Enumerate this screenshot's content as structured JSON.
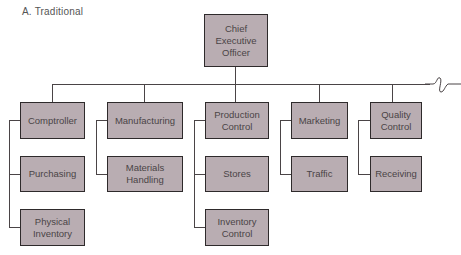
{
  "diagram": {
    "title": "A. Traditional",
    "type": "organization-chart",
    "root": {
      "label": "Chief\nExecutive\nOfficer"
    },
    "departments": [
      {
        "label": "Comptroller",
        "children": [
          "Purchasing",
          "Physical Inventory"
        ]
      },
      {
        "label": "Manufacturing",
        "children": [
          "Materials Handling"
        ]
      },
      {
        "label": "Production Control",
        "children": [
          "Stores",
          "Inventory Control"
        ]
      },
      {
        "label": "Marketing",
        "children": [
          "Traffic"
        ]
      },
      {
        "label": "Quality Control",
        "children": [
          "Receiving"
        ]
      }
    ],
    "colors": {
      "box_fill": "#b9adb2",
      "box_border": "#2e2a2b",
      "line": "#4a4446"
    }
  },
  "labels": {
    "ceo_1": "Chief",
    "ceo_2": "Executive",
    "ceo_3": "Officer",
    "comptroller": "Comptroller",
    "purchasing": "Purchasing",
    "physical_1": "Physical",
    "physical_2": "Inventory",
    "manufacturing": "Manufacturing",
    "materials_1": "Materials",
    "materials_2": "Handling",
    "production_1": "Production",
    "production_2": "Control",
    "stores": "Stores",
    "inventory_1": "Inventory",
    "inventory_2": "Control",
    "marketing": "Marketing",
    "traffic": "Traffic",
    "quality_1": "Quality",
    "quality_2": "Control",
    "receiving": "Receiving"
  }
}
